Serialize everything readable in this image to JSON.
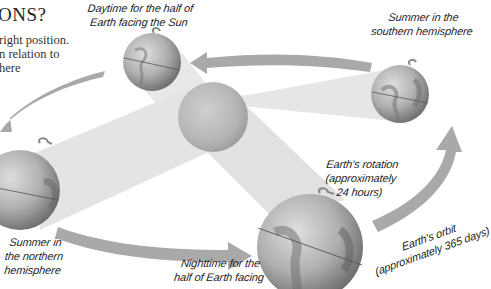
{
  "header": {
    "title_fragment": "ONS?",
    "body_lines": [
      "right position.",
      "n relation to",
      "here"
    ]
  },
  "labels": {
    "daytime": [
      "Daytime for the half of",
      "Earth facing the Sun"
    ],
    "summer_south": [
      "Summer in the",
      "southern hemisphere"
    ],
    "rotation": [
      "Earth's rotation",
      "(approximately",
      "24 hours)"
    ],
    "orbit": [
      "Earth's orbit",
      "(approximately 365 days)"
    ],
    "summer_north": [
      "Summer in",
      "the northern",
      "hemisphere"
    ],
    "nighttime": [
      "Nighttime for the",
      "half of Earth facing"
    ]
  },
  "colors": {
    "arrow": "#a9a9a9",
    "beam": "#e3e3e3",
    "sun": "#b8b8b8",
    "globe_light": "#d0d0d0",
    "globe_dark": "#6d6d6d",
    "text": "#222222"
  },
  "objects": {
    "sun": {
      "cx": 213,
      "cy": 117,
      "r": 35
    },
    "globes": [
      {
        "id": "top",
        "cx": 152,
        "cy": 62,
        "r": 29
      },
      {
        "id": "right",
        "cx": 400,
        "cy": 94,
        "r": 29
      },
      {
        "id": "left",
        "cx": 20,
        "cy": 190,
        "r": 40
      },
      {
        "id": "bottom",
        "cx": 310,
        "cy": 247,
        "r": 53
      }
    ]
  }
}
